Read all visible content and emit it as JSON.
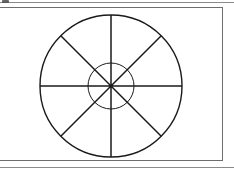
{
  "page": {
    "width": 234,
    "height": 169,
    "background_color": "#ffffff",
    "ink_color": "#1a1a1a",
    "rule_color": "#8a8a8a",
    "frame_color": "#6e6e6e"
  },
  "top_rule": {
    "label": "page top rule"
  },
  "bottom_rule": {
    "label": "page bottom rule"
  },
  "corner_smudge": {
    "label": "scan artifact smudge"
  },
  "figure": {
    "label": "wheel diagram figure",
    "frame": {
      "label": "figure border box",
      "x": -4,
      "y": 7,
      "width": 227,
      "height": 154
    },
    "wheel": {
      "label": "spoked wheel",
      "center_x": 111,
      "center_y": 86,
      "outer_radius": 71,
      "inner_radius": 23,
      "spoke_count": 8,
      "spoke_angles_deg": [
        0,
        45,
        90,
        135,
        180,
        225,
        270,
        315
      ],
      "stroke_width_outer": 1.4,
      "stroke_width_inner": 1.0,
      "stroke_width_spoke": 1.5,
      "hub_radius": 1.8
    }
  }
}
